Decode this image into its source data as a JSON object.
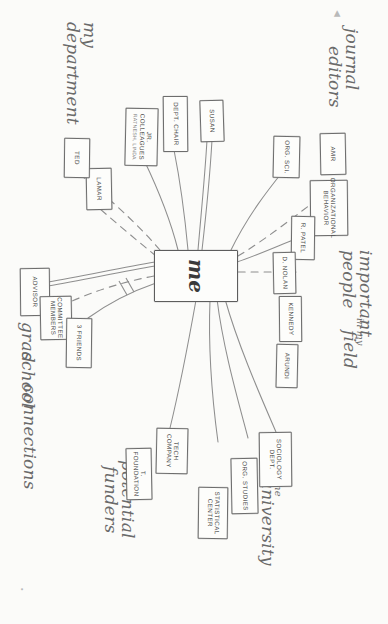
{
  "diagram": {
    "center_node": {
      "label": "me"
    },
    "captions": [
      {
        "id": "journal-editors",
        "line1": "journal",
        "line2": "editors"
      },
      {
        "id": "important-people",
        "line1": "important",
        "line2": "people",
        "line3": "in my",
        "line4": "field"
      },
      {
        "id": "the-university",
        "line1": "the",
        "line2": "university"
      },
      {
        "id": "potential-funders",
        "line1": "potential",
        "line2": "funders"
      },
      {
        "id": "my-department",
        "line1": "my",
        "line2": "department"
      },
      {
        "id": "grad-school-connections",
        "line1": "grad",
        "line2": "school",
        "line3": "connections"
      }
    ],
    "clusters": [
      {
        "name": "journal editors",
        "nodes": [
          {
            "id": "amr",
            "label": "AMR",
            "sub": ""
          },
          {
            "id": "organizational-behavior",
            "label": "ORGANIZATIONAL BEHAVIOR",
            "sub": ""
          },
          {
            "id": "org-sci",
            "label": "ORG. SCI.",
            "sub": ""
          }
        ]
      },
      {
        "name": "important people in my field",
        "nodes": [
          {
            "id": "r-patel",
            "label": "R. PATEL",
            "sub": ""
          },
          {
            "id": "d-nolan",
            "label": "D. NOLAN",
            "sub": ""
          },
          {
            "id": "kennedy",
            "label": "KENNEDY",
            "sub": ""
          },
          {
            "id": "arundi",
            "label": "ARUNDI",
            "sub": ""
          }
        ]
      },
      {
        "name": "the university",
        "nodes": [
          {
            "id": "sociology-dept",
            "label": "SOCIOLOGY DEPT.",
            "sub": ""
          },
          {
            "id": "org-studies",
            "label": "ORG. STUDIES",
            "sub": ""
          },
          {
            "id": "statistical-center",
            "label": "STATISTICAL CENTER",
            "sub": ""
          }
        ]
      },
      {
        "name": "potential funders",
        "nodes": [
          {
            "id": "tech-company",
            "label": "TECH COMPANY",
            "sub": ""
          },
          {
            "id": "t-foundation",
            "label": "T. FOUNDATION",
            "sub": ""
          }
        ]
      },
      {
        "name": "my department",
        "nodes": [
          {
            "id": "susan",
            "label": "SUSAN",
            "sub": ""
          },
          {
            "id": "dept-chair",
            "label": "DEPT. CHAIR",
            "sub": ""
          },
          {
            "id": "jr-colleagues",
            "label": "JR. COLLEAGUES",
            "sub": "RATNESH, LINDA"
          },
          {
            "id": "lamar",
            "label": "LAMAR",
            "sub": ""
          },
          {
            "id": "ted",
            "label": "TED",
            "sub": ""
          }
        ]
      },
      {
        "name": "grad school connections",
        "nodes": [
          {
            "id": "advisor",
            "label": "ADVISOR",
            "sub": ""
          },
          {
            "id": "committee-members",
            "label": "COMMITTEE MEMBERS",
            "sub": ""
          },
          {
            "id": "3-friends",
            "label": "3 FRIENDS",
            "sub": ""
          }
        ]
      }
    ],
    "colors": {
      "ink": "#6d6d6d",
      "paper": "#fbfbf9",
      "caption_ink": "#6a6a6a"
    },
    "edge_styles": {
      "solid": "existing tie",
      "dashed": "weak or desired tie"
    }
  }
}
